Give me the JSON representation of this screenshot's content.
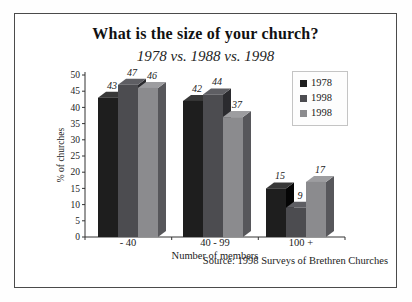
{
  "header": {
    "title": "What is the size of your church?",
    "subtitle": "1978 vs. 1988 vs. 1998"
  },
  "footer": {
    "source": "Source: 1998 Surveys of Brethren Churches"
  },
  "chart_data": {
    "type": "bar",
    "title": "What is the size of your church?",
    "subtitle": "1978 vs. 1988 vs. 1998",
    "categories": [
      "- 40",
      "40 - 99",
      "100 +"
    ],
    "series": [
      {
        "name": "1978",
        "values": [
          43,
          42,
          15
        ],
        "color": "#1e1e1e",
        "color_side": "#050505",
        "color_top": "#383838"
      },
      {
        "name": "1998",
        "values": [
          47,
          44,
          9
        ],
        "color": "#4c4c50",
        "color_side": "#2b2b2f",
        "color_top": "#5e5e63"
      },
      {
        "name": "1998",
        "values": [
          46,
          37,
          17
        ],
        "color": "#8b8b8e",
        "color_side": "#57575b",
        "color_top": "#9d9da0"
      }
    ],
    "xlabel": "Number of members",
    "ylabel": "% of churches",
    "ylim": [
      0,
      50
    ],
    "yticks": [
      0,
      5,
      10,
      15,
      20,
      25,
      30,
      35,
      40,
      45,
      50
    ],
    "value_labels": true,
    "legend_position": "top-right",
    "grid": false
  }
}
